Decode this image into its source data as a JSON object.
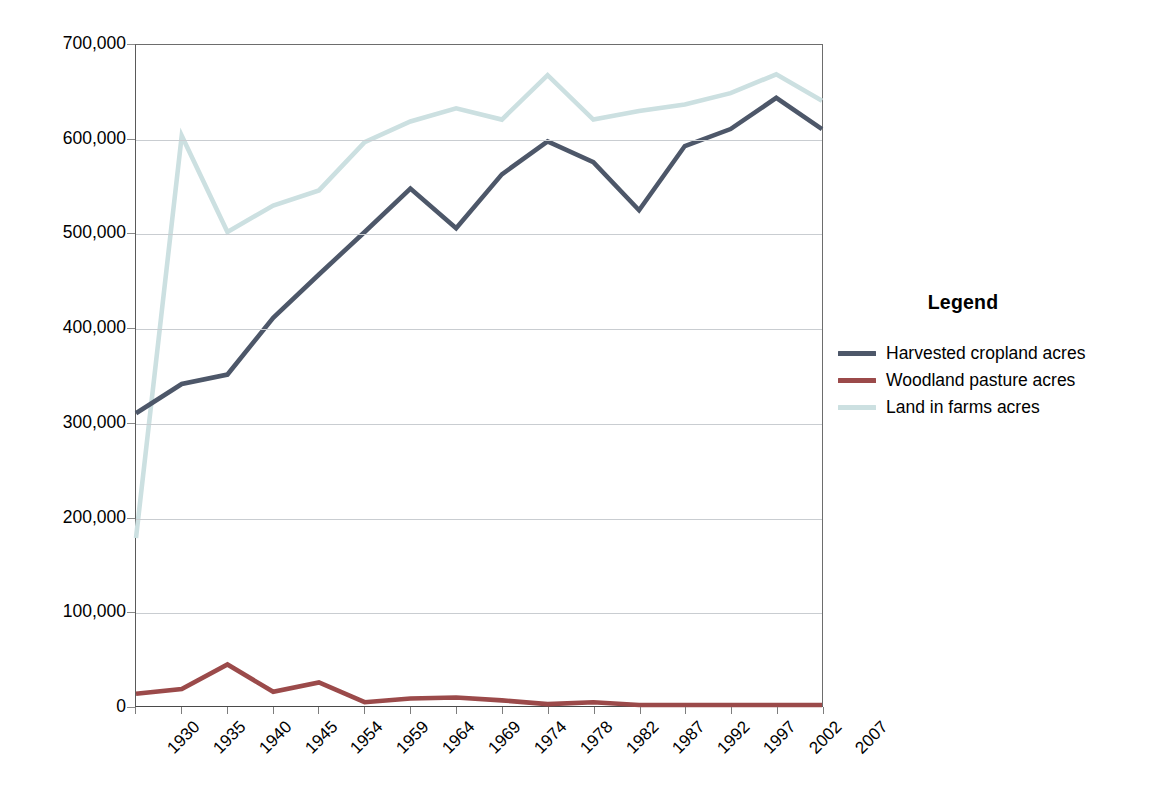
{
  "chart_data": {
    "type": "line",
    "title": "",
    "xlabel": "",
    "ylabel": "",
    "ylim": [
      0,
      700000
    ],
    "ytick_step": 100000,
    "grid": true,
    "legend_position": "right",
    "legend_title": "Legend",
    "ytick_labels": [
      "700,000",
      "600,000",
      "500,000",
      "400,000",
      "300,000",
      "200,000",
      "100,000",
      "0"
    ],
    "ytick_values": [
      700000,
      600000,
      500000,
      400000,
      300000,
      200000,
      100000,
      0
    ],
    "categories": [
      "1930",
      "1935",
      "1940",
      "1945",
      "1954",
      "1959",
      "1964",
      "1969",
      "1974",
      "1978",
      "1982",
      "1987",
      "1992",
      "1997",
      "2002",
      "2007"
    ],
    "series": [
      {
        "name": "Harvested cropland acres",
        "color": "#4d5769",
        "values": [
          310000,
          341000,
          351000,
          411000,
          457000,
          502000,
          548000,
          506000,
          563000,
          598000,
          576000,
          525000,
          593000,
          611000,
          644000,
          611000
        ]
      },
      {
        "name": "Woodland pasture acres",
        "color": "#9b4a4a",
        "values": [
          13000,
          18000,
          44000,
          15000,
          25000,
          4000,
          8000,
          9000,
          6000,
          2000,
          4000,
          1000,
          1000,
          1000,
          1000,
          1000
        ]
      },
      {
        "name": "Land in farms acres",
        "color": "#cce0e1",
        "values": [
          178000,
          604000,
          502000,
          530000,
          546000,
          597000,
          619000,
          633000,
          621000,
          668000,
          621000,
          630000,
          637000,
          649000,
          669000,
          641000
        ]
      }
    ]
  }
}
